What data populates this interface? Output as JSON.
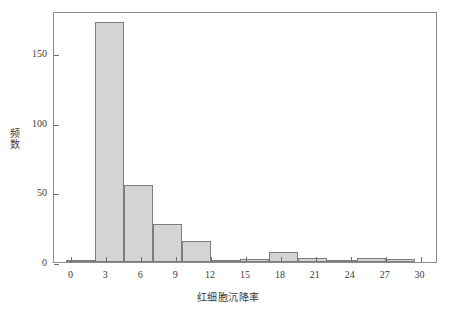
{
  "chart_data": {
    "type": "bar",
    "title": "",
    "subtitle": "",
    "xlabel": "红细胞沉降率",
    "ylabel": "频数",
    "xlim": [
      -1.5,
      31.5
    ],
    "ylim": [
      0,
      180
    ],
    "xticks": [
      0,
      3,
      6,
      9,
      12,
      15,
      18,
      21,
      24,
      27,
      30
    ],
    "xtick_labels": [
      "0",
      "3",
      "6",
      "9",
      "12",
      "15",
      "18",
      "21",
      "24",
      "27",
      "30"
    ],
    "yticks": [
      0,
      50,
      100,
      150
    ],
    "ytick_labels": [
      "0",
      "50",
      "100",
      "150"
    ],
    "grid": false,
    "legend": null,
    "bin_width": 2.5,
    "bin_edges": [
      -0.5,
      2.0,
      4.5,
      7.0,
      9.5,
      12.0,
      14.5,
      17.0,
      19.5,
      22.0,
      24.5,
      27.0,
      29.5
    ],
    "categories": [
      "-0.5–2.0",
      "2.0–4.5",
      "4.5–7.0",
      "7.0–9.5",
      "9.5–12.0",
      "12.0–14.5",
      "14.5–17.0",
      "17.0–19.5",
      "19.5–22.0",
      "22.0–24.5",
      "24.5–27.0",
      "27.0–29.5"
    ],
    "values": [
      1,
      172,
      55,
      27,
      15,
      1,
      2,
      7,
      3,
      1,
      3,
      2
    ],
    "bar_fill_color": "#d4d4d4",
    "bar_edge_color": "#7d7d7d",
    "axis_color": "#8c8c8c",
    "text_color": "#3c3c3c",
    "background_color": "#ffffff"
  }
}
